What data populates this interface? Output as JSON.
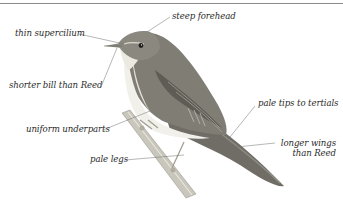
{
  "diagram": {
    "labels": {
      "steep_forehead": "steep forehead",
      "thin_supercilium": "thin supercilium",
      "shorter_bill": "shorter bill than Reed",
      "pale_tips": "pale tips to tertials",
      "uniform_underparts": "uniform underparts",
      "longer_wings_1": "longer wings",
      "longer_wings_2": "than Reed",
      "pale_legs": "pale legs"
    },
    "colors": {
      "rule": "#8a8a8a",
      "label_text": "#2b2b2b",
      "leader_line": "#6f6f6f",
      "upperparts": "#7d7b72",
      "underparts": "#f1efe8",
      "branch": "#b9b6aa"
    }
  }
}
